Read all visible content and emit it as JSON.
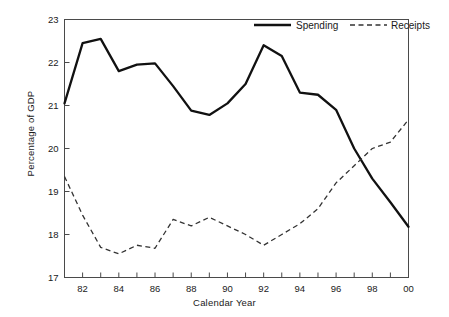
{
  "chart_data": {
    "type": "line",
    "title": "",
    "xlabel": "Calendar Year",
    "ylabel": "Percentage of GDP",
    "xlim": [
      81,
      100
    ],
    "ylim": [
      17,
      23
    ],
    "xticks": [
      "82",
      "84",
      "86",
      "88",
      "90",
      "92",
      "94",
      "96",
      "98",
      "00"
    ],
    "xtick_values": [
      82,
      84,
      86,
      88,
      90,
      92,
      94,
      96,
      98,
      100
    ],
    "yticks": [
      "17",
      "18",
      "19",
      "20",
      "21",
      "22",
      "23"
    ],
    "ytick_values": [
      17,
      18,
      19,
      20,
      21,
      22,
      23
    ],
    "grid": false,
    "legend_position": "top-right",
    "x": [
      81,
      82,
      83,
      84,
      85,
      86,
      87,
      88,
      89,
      90,
      91,
      92,
      93,
      94,
      95,
      96,
      97,
      98,
      99,
      100
    ],
    "series": [
      {
        "name": "Spending",
        "style": "solid",
        "color": "#111111",
        "values": [
          21.05,
          22.45,
          22.55,
          21.8,
          21.95,
          21.98,
          21.45,
          20.88,
          20.78,
          21.05,
          21.5,
          22.4,
          22.15,
          21.3,
          21.25,
          20.9,
          20.0,
          19.3,
          18.75,
          18.18
        ]
      },
      {
        "name": "Receipts",
        "style": "dashed",
        "color": "#333333",
        "values": [
          19.35,
          18.45,
          17.7,
          17.55,
          17.75,
          17.68,
          18.35,
          18.2,
          18.4,
          18.2,
          18.0,
          17.75,
          18.0,
          18.25,
          18.6,
          19.2,
          19.6,
          20.0,
          20.15,
          20.67
        ]
      }
    ]
  },
  "legend": {
    "spending_label": "Spending",
    "receipts_label": "Receipts"
  },
  "axes": {
    "x_title": "Calendar Year",
    "y_title": "Percentage of GDP"
  }
}
